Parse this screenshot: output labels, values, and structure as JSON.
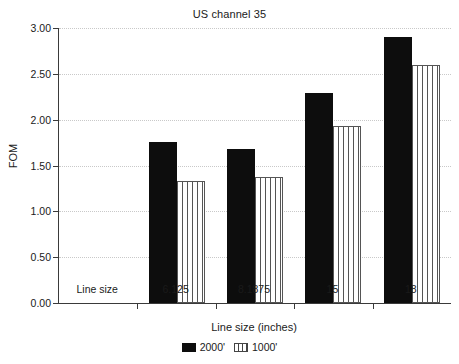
{
  "chart_data": {
    "type": "bar",
    "title": "US channel 35",
    "xlabel": "Line size (inches)",
    "ylabel": "FOM",
    "categories": [
      "Line size",
      "6.125",
      "8.1875",
      "15",
      "18"
    ],
    "series": [
      {
        "name": "2000'",
        "style": "solid-black",
        "values": [
          null,
          1.76,
          1.68,
          2.29,
          2.9
        ]
      },
      {
        "name": "1000'",
        "style": "vertical-stripes",
        "values": [
          null,
          1.33,
          1.37,
          1.93,
          2.6
        ]
      }
    ],
    "ylim": [
      0.0,
      3.0
    ],
    "ytick_values": [
      0.0,
      0.5,
      1.0,
      1.5,
      2.0,
      2.5,
      3.0
    ],
    "ytick_labels": [
      "0.00",
      "0.50",
      "1.00",
      "1.50",
      "2.00",
      "2.50",
      "3.00"
    ],
    "grid": true,
    "grid_axis": "y",
    "legend_position": "bottom-center",
    "colors": {
      "series_2000": "#0d0d0d",
      "series_1000_stroke": "#555555",
      "series_1000_fill": "#ffffff",
      "axis": "#3a3a3a",
      "gridline": "#c9c9c9",
      "background": "#ffffff",
      "text": "#1a1a1a"
    }
  },
  "legend": {
    "entries": [
      {
        "label": "2000'"
      },
      {
        "label": "1000'"
      }
    ]
  }
}
